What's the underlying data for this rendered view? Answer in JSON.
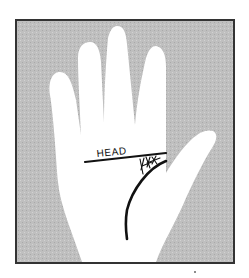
{
  "diagram": {
    "labels": {
      "head_line": "HEAD"
    },
    "colors": {
      "page_background": "#ffffff",
      "panel_background": "#bdbdbd",
      "panel_border": "#333333",
      "hand_fill": "#ffffff",
      "line_ink": "#111111"
    },
    "elements": [
      {
        "name": "hand-silhouette",
        "type": "shape"
      },
      {
        "name": "head-line",
        "type": "line",
        "label": "HEAD"
      },
      {
        "name": "life-line",
        "type": "curve"
      },
      {
        "name": "branch-lines",
        "type": "cross-hatching"
      }
    ]
  }
}
